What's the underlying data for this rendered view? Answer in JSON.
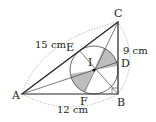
{
  "diagram": {
    "type": "geometry",
    "points": {
      "A": {
        "label": "A",
        "x": 22,
        "y": 94
      },
      "B": {
        "label": "B",
        "x": 118,
        "y": 94
      },
      "C": {
        "label": "C",
        "x": 118,
        "y": 22
      },
      "I": {
        "label": "I",
        "x": 94,
        "y": 70
      },
      "D": {
        "label": "D",
        "x": 118,
        "y": 70
      },
      "E": {
        "label": "E",
        "x": 79.6,
        "y": 50.8
      },
      "F": {
        "label": "F",
        "x": 94,
        "y": 94
      }
    },
    "measurements": {
      "AC": "15 cm",
      "BC": "9 cm",
      "AB": "12 cm"
    },
    "incircle_radius_px": 24,
    "colors": {
      "line": "#222222",
      "shade": "#bdbdbd",
      "dotted": "#9a9a9a"
    }
  }
}
